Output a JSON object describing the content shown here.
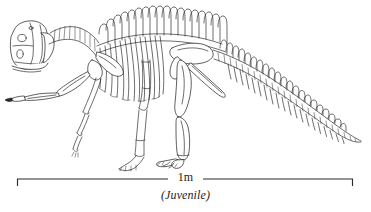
{
  "figure": {
    "background_color": "#ffffff",
    "line_color": "#1b1b1b",
    "width": 371,
    "height": 212
  },
  "scale_bar": {
    "label": "1m",
    "left_tick_x": 17,
    "right_tick_x": 353,
    "baseline_y": 179,
    "tick_height": 7,
    "gap_start_x": 168,
    "gap_end_x": 203
  },
  "caption": {
    "text": "(Juvenile)"
  },
  "skeleton_parts": {
    "skull": "skull",
    "mandible": "mandible",
    "cervical_vertebrae": "cervical-vertebrae",
    "dorsal_vertebrae": "dorsal-vertebrae",
    "neural_spines": "neural-spines",
    "ribs": "dorsal-ribs",
    "scapula": "scapula",
    "coracoid": "coracoid",
    "humerus": "humerus",
    "radius_ulna": "radius-ulna",
    "manus": "manus",
    "ilium": "ilium",
    "pubis": "pubis",
    "ischium": "ischium",
    "femur": "femur",
    "tibia_fibula": "tibia-fibula",
    "pes": "pes",
    "caudal_vertebrae": "caudal-vertebrae",
    "chevrons": "chevrons"
  }
}
